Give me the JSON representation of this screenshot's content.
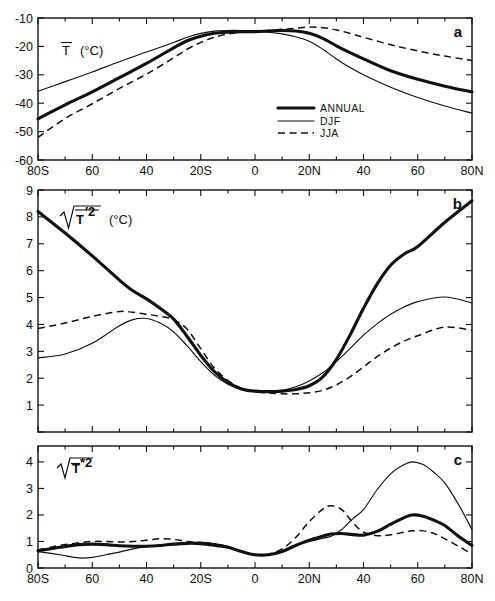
{
  "figure": {
    "background": "#ffffff",
    "line_color": "#111111",
    "panels": [
      "a",
      "b",
      "c"
    ]
  },
  "legend": {
    "position": "panel-a-inside-right",
    "entries": [
      {
        "label": "ANNUAL",
        "style": "thick-solid"
      },
      {
        "label": "DJF",
        "style": "thin-solid"
      },
      {
        "label": "JJA",
        "style": "dashed"
      }
    ]
  },
  "chart_data": [
    {
      "type": "line",
      "panel": "a",
      "title": "",
      "ylabel": "T̄  (°C)",
      "ylabel_parts": {
        "sym": "T",
        "overbar": true,
        "unit": "(°C)"
      },
      "xlabel": "",
      "ylim": [
        -60,
        -10
      ],
      "yticks": [
        -10,
        -20,
        -30,
        -40,
        -50,
        -60
      ],
      "ytick_labels": [
        "-10",
        "-20",
        "-30",
        "-40",
        "-50",
        "-60"
      ],
      "xlim": [
        -80,
        80
      ],
      "xticks": [
        -80,
        -60,
        -40,
        -20,
        0,
        20,
        40,
        60,
        80
      ],
      "xtick_labels": [
        "80S",
        "60",
        "40",
        "20S",
        "0",
        "20N",
        "40",
        "60",
        "80N"
      ],
      "grid": false,
      "x": [
        -80,
        -70,
        -60,
        -50,
        -40,
        -30,
        -25,
        -20,
        -15,
        -10,
        -5,
        0,
        5,
        10,
        15,
        20,
        25,
        30,
        35,
        40,
        50,
        60,
        70,
        80
      ],
      "series": [
        {
          "name": "ANNUAL",
          "style": "thick-solid",
          "values": [
            -45.5,
            -40.6,
            -36.0,
            -31.0,
            -26.0,
            -20.5,
            -18.0,
            -16.4,
            -15.4,
            -15.0,
            -14.8,
            -14.8,
            -14.6,
            -14.4,
            -14.6,
            -15.4,
            -17.2,
            -19.8,
            -22.2,
            -24.4,
            -28.6,
            -31.6,
            -34.0,
            -36.0
          ]
        },
        {
          "name": "DJF",
          "style": "thin-solid",
          "values": [
            -35.8,
            -32.4,
            -29.0,
            -25.4,
            -22.0,
            -18.6,
            -16.8,
            -15.4,
            -14.6,
            -14.4,
            -14.4,
            -14.6,
            -15.0,
            -15.6,
            -16.6,
            -18.2,
            -21.0,
            -24.4,
            -27.4,
            -30.0,
            -34.4,
            -38.0,
            -41.0,
            -43.5
          ]
        },
        {
          "name": "JJA",
          "style": "dashed",
          "values": [
            -52.0,
            -45.4,
            -40.2,
            -34.8,
            -29.8,
            -24.0,
            -21.0,
            -18.6,
            -16.8,
            -15.6,
            -15.0,
            -14.8,
            -14.4,
            -14.0,
            -13.6,
            -13.2,
            -13.4,
            -14.2,
            -15.4,
            -16.8,
            -19.4,
            -21.6,
            -23.4,
            -25.0
          ]
        }
      ]
    },
    {
      "type": "line",
      "panel": "b",
      "title": "",
      "ylabel": "sqrt(mean T'^2)  (°C)",
      "ylabel_parts": {
        "sqrt": true,
        "sym": "T",
        "prime": true,
        "power": "2",
        "overbar": true,
        "unit": "(°C)"
      },
      "xlabel": "",
      "ylim": [
        0,
        9
      ],
      "yticks": [
        0,
        1,
        2,
        3,
        4,
        5,
        6,
        7,
        8,
        9
      ],
      "ytick_labels": [
        "0",
        "1",
        "2",
        "3",
        "4",
        "5",
        "6",
        "7",
        "8",
        "9"
      ],
      "ytick_labels_shown": [
        "1",
        "2",
        "3",
        "4",
        "5",
        "6",
        "7",
        "8",
        "9"
      ],
      "xlim": [
        -80,
        80
      ],
      "xticks": [
        -80,
        -60,
        -40,
        -20,
        0,
        20,
        40,
        60,
        80
      ],
      "grid": false,
      "x": [
        -80,
        -70,
        -60,
        -50,
        -45,
        -40,
        -35,
        -30,
        -25,
        -20,
        -15,
        -10,
        -5,
        0,
        5,
        10,
        15,
        20,
        25,
        30,
        35,
        40,
        45,
        50,
        55,
        60,
        70,
        80
      ],
      "series": [
        {
          "name": "ANNUAL",
          "style": "thick-solid",
          "values": [
            8.2,
            7.4,
            6.55,
            5.65,
            5.25,
            4.95,
            4.6,
            4.2,
            3.55,
            2.85,
            2.25,
            1.85,
            1.6,
            1.52,
            1.5,
            1.52,
            1.58,
            1.72,
            2.05,
            2.7,
            3.6,
            4.6,
            5.5,
            6.2,
            6.62,
            6.9,
            7.8,
            8.6
          ]
        },
        {
          "name": "DJF",
          "style": "thin-solid",
          "values": [
            2.75,
            2.9,
            3.3,
            3.95,
            4.18,
            4.22,
            4.05,
            3.72,
            3.2,
            2.62,
            2.12,
            1.78,
            1.58,
            1.5,
            1.5,
            1.55,
            1.68,
            1.9,
            2.2,
            2.62,
            3.1,
            3.6,
            4.02,
            4.38,
            4.65,
            4.85,
            5.02,
            4.8
          ]
        },
        {
          "name": "JJA",
          "style": "dashed",
          "values": [
            3.85,
            4.05,
            4.3,
            4.48,
            4.45,
            4.38,
            4.3,
            4.18,
            3.82,
            3.1,
            2.38,
            1.92,
            1.62,
            1.5,
            1.45,
            1.42,
            1.42,
            1.46,
            1.55,
            1.75,
            2.05,
            2.42,
            2.8,
            3.12,
            3.38,
            3.58,
            3.9,
            3.78
          ]
        }
      ]
    },
    {
      "type": "line",
      "panel": "c",
      "title": "",
      "ylabel": "sqrt(mean T*^2)",
      "ylabel_parts": {
        "sqrt": true,
        "sym": "T",
        "overbar": true,
        "star": true,
        "power": "2"
      },
      "xlabel": "",
      "ylim": [
        0,
        4.6
      ],
      "yticks": [
        0,
        1,
        2,
        3,
        4
      ],
      "ytick_labels": [
        "0",
        "1",
        "2",
        "3",
        "4"
      ],
      "xlim": [
        -80,
        80
      ],
      "xticks": [
        -80,
        -60,
        -40,
        -20,
        0,
        20,
        40,
        60,
        80
      ],
      "xtick_labels": [
        "80S",
        "60",
        "40",
        "20S",
        "0",
        "20N",
        "40",
        "60",
        "80N"
      ],
      "grid": false,
      "x": [
        -80,
        -72,
        -65,
        -60,
        -55,
        -50,
        -45,
        -40,
        -35,
        -30,
        -25,
        -20,
        -15,
        -10,
        -5,
        0,
        5,
        10,
        15,
        20,
        25,
        28,
        32,
        36,
        40,
        45,
        50,
        55,
        58,
        62,
        66,
        70,
        75,
        80
      ],
      "series": [
        {
          "name": "ANNUAL",
          "style": "thick-solid",
          "values": [
            0.65,
            0.78,
            0.88,
            0.9,
            0.88,
            0.84,
            0.82,
            0.82,
            0.85,
            0.9,
            0.93,
            0.92,
            0.86,
            0.78,
            0.62,
            0.5,
            0.5,
            0.62,
            0.85,
            1.05,
            1.2,
            1.28,
            1.3,
            1.26,
            1.24,
            1.38,
            1.65,
            1.9,
            2.0,
            1.95,
            1.8,
            1.6,
            1.2,
            0.85
          ]
        },
        {
          "name": "DJF",
          "style": "thin-solid",
          "values": [
            0.62,
            0.5,
            0.38,
            0.4,
            0.5,
            0.6,
            0.72,
            0.8,
            0.85,
            0.9,
            0.95,
            0.98,
            0.92,
            0.82,
            0.65,
            0.5,
            0.5,
            0.62,
            0.85,
            1.0,
            1.12,
            1.2,
            1.45,
            1.85,
            2.2,
            2.95,
            3.55,
            3.9,
            4.0,
            3.9,
            3.6,
            3.2,
            2.4,
            1.45
          ]
        },
        {
          "name": "JJA",
          "style": "dashed",
          "values": [
            0.68,
            0.85,
            0.95,
            1.0,
            1.0,
            0.98,
            1.0,
            1.05,
            1.1,
            1.08,
            1.0,
            0.95,
            0.9,
            0.8,
            0.62,
            0.5,
            0.52,
            0.72,
            1.15,
            1.75,
            2.22,
            2.35,
            2.2,
            1.72,
            1.35,
            1.22,
            1.25,
            1.35,
            1.4,
            1.4,
            1.3,
            1.1,
            0.82,
            0.52
          ]
        }
      ]
    }
  ]
}
